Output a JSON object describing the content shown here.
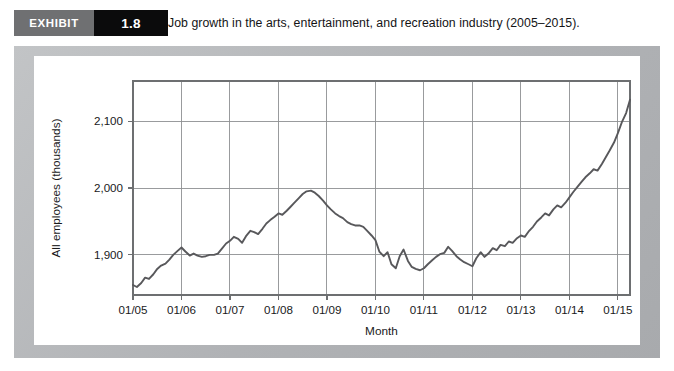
{
  "exhibit": {
    "label": "EXHIBIT",
    "number": "1.8",
    "title": "Job growth in the arts, entertainment, and recreation industry (2005–2015).",
    "label_bg": "#6f7072",
    "number_bg": "#0b0b0c",
    "frame_color": "#b7b9bb",
    "card_color": "#ffffff"
  },
  "chart_data": {
    "type": "line",
    "title": "",
    "xlabel": "Month",
    "ylabel": "All employees (thousands)",
    "ylim": [
      1840,
      2160
    ],
    "xlim": [
      2005.0,
      2015.25
    ],
    "yticks": [
      1900,
      2000,
      2100
    ],
    "ytick_labels": [
      "1,900",
      "2,000",
      "2,100"
    ],
    "xticks": [
      2005,
      2006,
      2007,
      2008,
      2009,
      2010,
      2011,
      2012,
      2013,
      2014,
      2015
    ],
    "xtick_labels": [
      "01/05",
      "01/06",
      "01/07",
      "01/08",
      "01/09",
      "01/10",
      "01/11",
      "01/12",
      "01/13",
      "01/14",
      "01/15"
    ],
    "grid": true,
    "legend": false,
    "line_color": "#58585b",
    "grid_color": "#8e9092",
    "series": [
      {
        "name": "All employees (thousands)",
        "x": [
          2005.0,
          2005.08,
          2005.17,
          2005.25,
          2005.33,
          2005.42,
          2005.5,
          2005.58,
          2005.67,
          2005.75,
          2005.83,
          2005.92,
          2006.0,
          2006.08,
          2006.17,
          2006.25,
          2006.33,
          2006.42,
          2006.5,
          2006.58,
          2006.67,
          2006.75,
          2006.83,
          2006.92,
          2007.0,
          2007.08,
          2007.17,
          2007.25,
          2007.33,
          2007.42,
          2007.5,
          2007.58,
          2007.67,
          2007.75,
          2007.83,
          2007.92,
          2008.0,
          2008.08,
          2008.17,
          2008.25,
          2008.33,
          2008.42,
          2008.5,
          2008.58,
          2008.67,
          2008.75,
          2008.83,
          2008.92,
          2009.0,
          2009.08,
          2009.17,
          2009.25,
          2009.33,
          2009.42,
          2009.5,
          2009.58,
          2009.67,
          2009.75,
          2009.83,
          2009.92,
          2010.0,
          2010.08,
          2010.17,
          2010.25,
          2010.33,
          2010.42,
          2010.5,
          2010.58,
          2010.67,
          2010.75,
          2010.83,
          2010.92,
          2011.0,
          2011.08,
          2011.17,
          2011.25,
          2011.33,
          2011.42,
          2011.5,
          2011.58,
          2011.67,
          2011.75,
          2011.83,
          2011.92,
          2012.0,
          2012.08,
          2012.17,
          2012.25,
          2012.33,
          2012.42,
          2012.5,
          2012.58,
          2012.67,
          2012.75,
          2012.83,
          2012.92,
          2013.0,
          2013.08,
          2013.17,
          2013.25,
          2013.33,
          2013.42,
          2013.5,
          2013.58,
          2013.67,
          2013.75,
          2013.83,
          2013.92,
          2014.0,
          2014.08,
          2014.17,
          2014.25,
          2014.33,
          2014.42,
          2014.5,
          2014.58,
          2014.67,
          2014.75,
          2014.83,
          2014.92,
          2015.0,
          2015.08,
          2015.17,
          2015.25
        ],
        "values": [
          1855,
          1852,
          1858,
          1866,
          1864,
          1871,
          1879,
          1884,
          1887,
          1893,
          1900,
          1906,
          1911,
          1905,
          1899,
          1902,
          1899,
          1897,
          1898,
          1900,
          1900,
          1902,
          1909,
          1917,
          1921,
          1927,
          1924,
          1918,
          1928,
          1936,
          1934,
          1931,
          1939,
          1947,
          1952,
          1957,
          1962,
          1960,
          1966,
          1972,
          1978,
          1985,
          1991,
          1995,
          1996,
          1993,
          1988,
          1981,
          1974,
          1968,
          1962,
          1958,
          1955,
          1949,
          1946,
          1944,
          1944,
          1942,
          1936,
          1929,
          1922,
          1905,
          1898,
          1904,
          1886,
          1880,
          1898,
          1908,
          1891,
          1882,
          1879,
          1877,
          1880,
          1886,
          1892,
          1897,
          1901,
          1903,
          1912,
          1906,
          1898,
          1893,
          1889,
          1886,
          1883,
          1895,
          1904,
          1897,
          1902,
          1910,
          1907,
          1915,
          1913,
          1920,
          1918,
          1925,
          1929,
          1927,
          1936,
          1942,
          1950,
          1956,
          1962,
          1959,
          1968,
          1974,
          1971,
          1978,
          1986,
          1994,
          2002,
          2009,
          2016,
          2022,
          2028,
          2026,
          2036,
          2046,
          2056,
          2068,
          2082,
          2098,
          2112,
          2132
        ]
      }
    ]
  },
  "chart_layout": {
    "plot_left": 99,
    "plot_top": 25,
    "plot_right": 596,
    "plot_bottom": 239
  }
}
